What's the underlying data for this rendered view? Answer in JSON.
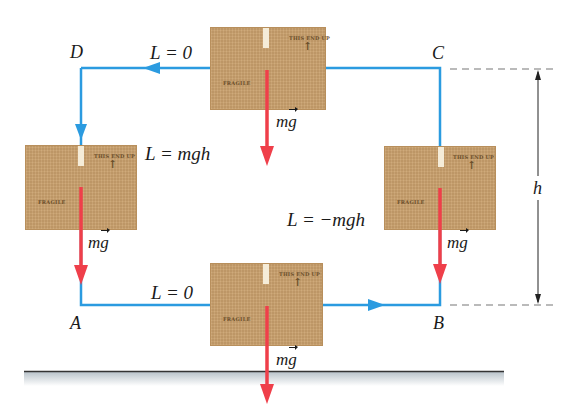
{
  "figure": {
    "colors": {
      "path": "#2b9be0",
      "weight_arrow": "#ef3f4a",
      "box": "#c9a06c",
      "box_text": "#6b4e2a",
      "ground_line": "#333333",
      "ground_shade": "#c8d0d6",
      "dimension": "#222222",
      "dash": "#777777"
    },
    "points": {
      "A": "A",
      "B": "B",
      "C": "C",
      "D": "D"
    },
    "segments": {
      "AB_work": "L = 0",
      "BC_work": "L = −mgh",
      "CD_work": "L = 0",
      "DA_work": "L = mgh"
    },
    "force_label": {
      "m": "m",
      "g": "g"
    },
    "dimension": {
      "label": "h"
    },
    "box_markings": {
      "orientation": "THIS END UP",
      "arrow": "↑",
      "fragile": "FRAGILE"
    }
  }
}
